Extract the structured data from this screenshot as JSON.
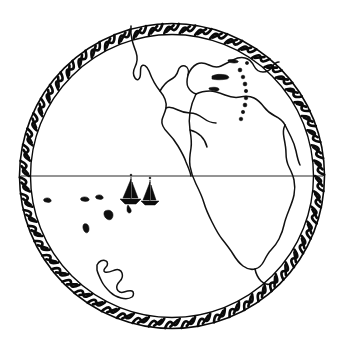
{
  "artwork": {
    "title": "Circular globe emblem of the Americas",
    "kind": "line-art illustration",
    "background_color": "#ffffff",
    "ink_color": "#0a0a0a",
    "caption": ""
  },
  "frame": {
    "name": "braided rope border",
    "shape": "circle",
    "center_x": 172,
    "center_y": 176,
    "outer_radius": 153,
    "inner_radius": 142,
    "band_width": 11,
    "strand_count": 58,
    "stroke_color": "#0a0a0a"
  },
  "globe": {
    "projection": "orthographic",
    "center_label": "Pacific / Americas",
    "fill_color": "#ffffff",
    "equator": {
      "name": "equator",
      "label": "",
      "y": 176,
      "x_start": 22,
      "x_end": 322,
      "stroke_color": "#2a2a2a"
    }
  },
  "landmasses": [
    {
      "name": "north-america-west-coast",
      "label": "North America"
    },
    {
      "name": "central-america",
      "label": "Central America"
    },
    {
      "name": "south-america",
      "label": "South America"
    },
    {
      "name": "cuba",
      "label": "Cuba"
    },
    {
      "name": "hispaniola",
      "label": "Hispaniola"
    },
    {
      "name": "lesser-antilles-arc",
      "label": "Lesser Antilles"
    }
  ],
  "islands": [
    {
      "name": "pacific-island-1",
      "label": "",
      "cx": 47,
      "cy": 200,
      "r": 2.4
    },
    {
      "name": "pacific-island-2",
      "label": "",
      "cx": 84,
      "cy": 199,
      "r": 2.0
    },
    {
      "name": "pacific-island-3",
      "label": "",
      "cx": 99,
      "cy": 197,
      "r": 2.2
    },
    {
      "name": "pacific-island-4",
      "label": "",
      "cx": 109,
      "cy": 215,
      "r": 3.0
    },
    {
      "name": "pacific-island-5",
      "label": "",
      "cx": 86,
      "cy": 228,
      "r": 2.2
    },
    {
      "name": "southern-island-outline",
      "label": ""
    }
  ],
  "vessels": [
    {
      "name": "sailboat-left",
      "label": "sailboat",
      "hull_x": 131,
      "hull_y": 200,
      "mast_top_y": 176,
      "scale": 1.0
    },
    {
      "name": "sailboat-right",
      "label": "sailboat",
      "hull_x": 150,
      "hull_y": 202,
      "mast_top_y": 179,
      "scale": 0.9
    }
  ]
}
